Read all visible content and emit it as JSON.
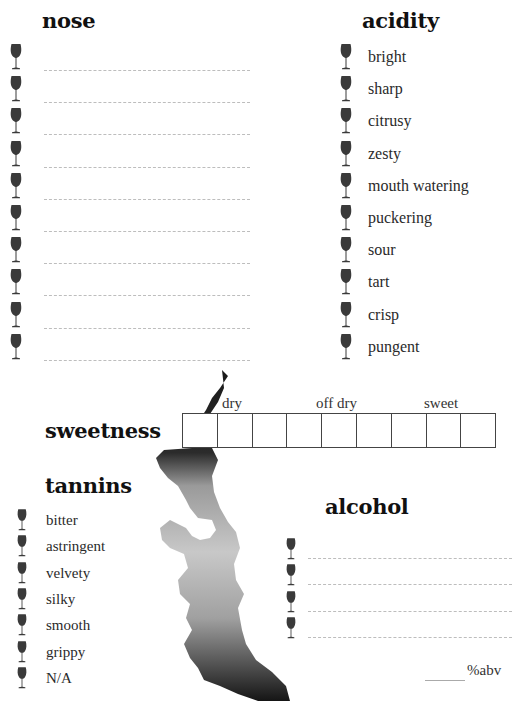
{
  "nose": {
    "title": "nose",
    "line_count": 10,
    "icon": "wine-glass-icon"
  },
  "acidity": {
    "title": "acidity",
    "items": [
      "bright",
      "sharp",
      "citrusy",
      "zesty",
      "mouth watering",
      "puckering",
      "sour",
      "tart",
      "crisp",
      "pungent"
    ]
  },
  "sweetness": {
    "title": "sweetness",
    "scale_labels": [
      "dry",
      "off dry",
      "sweet"
    ],
    "box_count": 9
  },
  "tannins": {
    "title": "tannins",
    "items": [
      "bitter",
      "astringent",
      "velvety",
      "silky",
      "smooth",
      "grippy",
      "N/A"
    ]
  },
  "alcohol": {
    "title": "alcohol",
    "line_count": 4,
    "abv_label": "%abv"
  },
  "colors": {
    "ink": "#111111",
    "glass": "#3a3a3a",
    "rule": "#bdbdbd"
  }
}
